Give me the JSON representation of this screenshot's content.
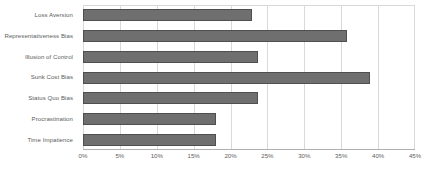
{
  "chart_data": {
    "type": "bar",
    "orientation": "horizontal",
    "title": "",
    "subtitle": "",
    "xlabel": "",
    "ylabel": "",
    "categories": [
      "Loss Aversion",
      "Representativeness Bias",
      "Illusion of Control",
      "Sunk Cost Bias",
      "Status Quo Bias",
      "Procrastination",
      "Time Impatience"
    ],
    "values": [
      22.9,
      35.8,
      23.7,
      38.9,
      23.7,
      18.0,
      18.0
    ],
    "value_unit": "%",
    "xlim": [
      0,
      45
    ],
    "xticks": [
      0,
      5,
      10,
      15,
      20,
      25,
      30,
      35,
      40,
      45
    ],
    "xtick_labels": [
      "0%",
      "5%",
      "10%",
      "15%",
      "20%",
      "25%",
      "30%",
      "35%",
      "40%",
      "45%"
    ],
    "grid": "vertical",
    "legend": "none",
    "colors": {
      "bar_fill": "#6f6f6f",
      "bar_border": "#4f4f4f",
      "gridline": "#d9d9d9",
      "axisline": "#b0b0b0",
      "text": "#5d5d5d",
      "background": "#ffffff"
    }
  }
}
